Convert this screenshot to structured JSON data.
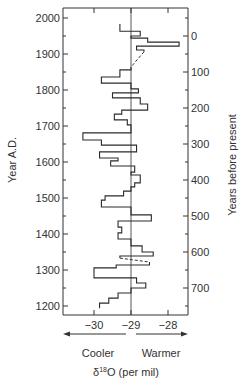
{
  "chart_data": {
    "type": "line",
    "style": "step",
    "title": "",
    "xlabel": "δ18O (per mil)",
    "xlabel_parts": {
      "delta": "δ",
      "sup": "18",
      "rest": "O (per mil)"
    },
    "ylabel_left": "Year A.D.",
    "ylabel_right": "Years before present",
    "xlim": [
      -30.9,
      -27.5
    ],
    "ylim": [
      1175,
      2027
    ],
    "x_ticks": [
      -30,
      -29,
      -28
    ],
    "x_tick_labels": [
      "−30",
      "−29",
      "−28"
    ],
    "y_left_ticks": [
      2000,
      1900,
      1800,
      1700,
      1600,
      1500,
      1400,
      1300,
      1200
    ],
    "y_left_tick_labels": [
      "2000",
      "1900",
      "1800",
      "1700",
      "1600",
      "1500",
      "1400",
      "1300",
      "1200"
    ],
    "y_right_ticks": [
      0,
      100,
      200,
      300,
      400,
      500,
      600,
      700
    ],
    "y_right_tick_labels": [
      "0",
      "100",
      "200",
      "300",
      "400",
      "500",
      "600",
      "700"
    ],
    "y_right_reference_year": 1950,
    "reference_line_x": -29,
    "annotations": {
      "left_arrow": "Cooler",
      "right_arrow": "Warmer"
    },
    "grid": false,
    "legend": null,
    "series": [
      {
        "name": "δ18O",
        "steps": [
          {
            "year_top": 1983,
            "year_bottom": 1963,
            "value": -29.3
          },
          {
            "year_top": 1963,
            "year_bottom": 1950,
            "value": -28.75
          },
          {
            "year_top": 1950,
            "year_bottom": 1944,
            "value": -29.0
          },
          {
            "year_top": 1944,
            "year_bottom": 1933,
            "value": -28.55
          },
          {
            "year_top": 1933,
            "year_bottom": 1922,
            "value": -27.7
          },
          {
            "year_top": 1922,
            "year_bottom": 1911,
            "value": -28.85
          },
          {
            "year_top": 1911,
            "year_bottom": 1906,
            "value": -28.65,
            "dashed_to": {
              "year": 1864,
              "value": -29.0
            }
          },
          {
            "year_top": 1864,
            "year_bottom": 1856,
            "value": -29.0
          },
          {
            "year_top": 1856,
            "year_bottom": 1836,
            "value": -29.3
          },
          {
            "year_top": 1836,
            "year_bottom": 1819,
            "value": -29.8
          },
          {
            "year_top": 1819,
            "year_bottom": 1803,
            "value": -29.0
          },
          {
            "year_top": 1803,
            "year_bottom": 1792,
            "value": -28.8
          },
          {
            "year_top": 1792,
            "year_bottom": 1778,
            "value": -29.5
          },
          {
            "year_top": 1778,
            "year_bottom": 1761,
            "value": -28.75
          },
          {
            "year_top": 1761,
            "year_bottom": 1744,
            "value": -28.55
          },
          {
            "year_top": 1744,
            "year_bottom": 1733,
            "value": -29.25
          },
          {
            "year_top": 1733,
            "year_bottom": 1717,
            "value": -29.45
          },
          {
            "year_top": 1717,
            "year_bottom": 1703,
            "value": -29.1
          },
          {
            "year_top": 1703,
            "year_bottom": 1681,
            "value": -29.0
          },
          {
            "year_top": 1681,
            "year_bottom": 1661,
            "value": -30.3
          },
          {
            "year_top": 1661,
            "year_bottom": 1647,
            "value": -29.8
          },
          {
            "year_top": 1647,
            "year_bottom": 1628,
            "value": -28.85
          },
          {
            "year_top": 1628,
            "year_bottom": 1611,
            "value": -29.85
          },
          {
            "year_top": 1611,
            "year_bottom": 1603,
            "value": -29.35
          },
          {
            "year_top": 1603,
            "year_bottom": 1589,
            "value": -29.55
          },
          {
            "year_top": 1589,
            "year_bottom": 1572,
            "value": -28.9
          },
          {
            "year_top": 1572,
            "year_bottom": 1564,
            "value": -29.0
          },
          {
            "year_top": 1564,
            "year_bottom": 1542,
            "value": -28.75
          },
          {
            "year_top": 1542,
            "year_bottom": 1531,
            "value": -28.9
          },
          {
            "year_top": 1531,
            "year_bottom": 1519,
            "value": -29.0
          },
          {
            "year_top": 1519,
            "year_bottom": 1506,
            "value": -29.2
          },
          {
            "year_top": 1506,
            "year_bottom": 1494,
            "value": -29.7
          },
          {
            "year_top": 1494,
            "year_bottom": 1475,
            "value": -29.8
          },
          {
            "year_top": 1475,
            "year_bottom": 1453,
            "value": -29.0
          },
          {
            "year_top": 1453,
            "year_bottom": 1436,
            "value": -28.45
          },
          {
            "year_top": 1436,
            "year_bottom": 1419,
            "value": -29.35
          },
          {
            "year_top": 1419,
            "year_bottom": 1403,
            "value": -29.25
          },
          {
            "year_top": 1403,
            "year_bottom": 1386,
            "value": -29.35
          },
          {
            "year_top": 1386,
            "year_bottom": 1367,
            "value": -29.0
          },
          {
            "year_top": 1367,
            "year_bottom": 1350,
            "value": -28.7
          },
          {
            "year_top": 1350,
            "year_bottom": 1339,
            "value": -28.4
          },
          {
            "year_top": 1339,
            "year_bottom": 1333,
            "value": -29.3,
            "dashed_to": {
              "year": 1322,
              "value": -28.5
            }
          },
          {
            "year_top": 1322,
            "year_bottom": 1314,
            "value": -28.5
          },
          {
            "year_top": 1314,
            "year_bottom": 1306,
            "value": -29.4
          },
          {
            "year_top": 1306,
            "year_bottom": 1278,
            "value": -30.0
          },
          {
            "year_top": 1278,
            "year_bottom": 1264,
            "value": -28.85
          },
          {
            "year_top": 1264,
            "year_bottom": 1250,
            "value": -28.6
          },
          {
            "year_top": 1250,
            "year_bottom": 1236,
            "value": -29.0
          },
          {
            "year_top": 1236,
            "year_bottom": 1222,
            "value": -29.35
          },
          {
            "year_top": 1222,
            "year_bottom": 1208,
            "value": -29.6
          },
          {
            "year_top": 1208,
            "year_bottom": 1194,
            "value": -29.85
          }
        ]
      }
    ]
  },
  "layout_px": {
    "plot_left": 63,
    "plot_right": 188,
    "plot_top": 8,
    "plot_bottom": 315,
    "x_ref_value": -29,
    "x_ref_px": 131,
    "px_per_unit": 37,
    "y_ref_year": 2000,
    "y_ref_px": 18,
    "px_per_year": 0.36
  }
}
